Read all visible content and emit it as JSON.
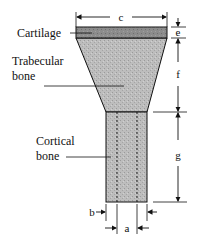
{
  "diagram": {
    "labels": {
      "cartilage": "Cartilage",
      "trabecular_line1": "Trabecular",
      "trabecular_line2": "bone",
      "cortical_line1": "Cortical",
      "cortical_line2": "bone"
    },
    "dimensions": {
      "a": "a",
      "b": "b",
      "c": "c",
      "e": "e",
      "f": "f",
      "g": "g"
    },
    "colors": {
      "cartilage": "#8a8a8a",
      "bone": "#b9b9b9",
      "line": "#111111"
    }
  }
}
